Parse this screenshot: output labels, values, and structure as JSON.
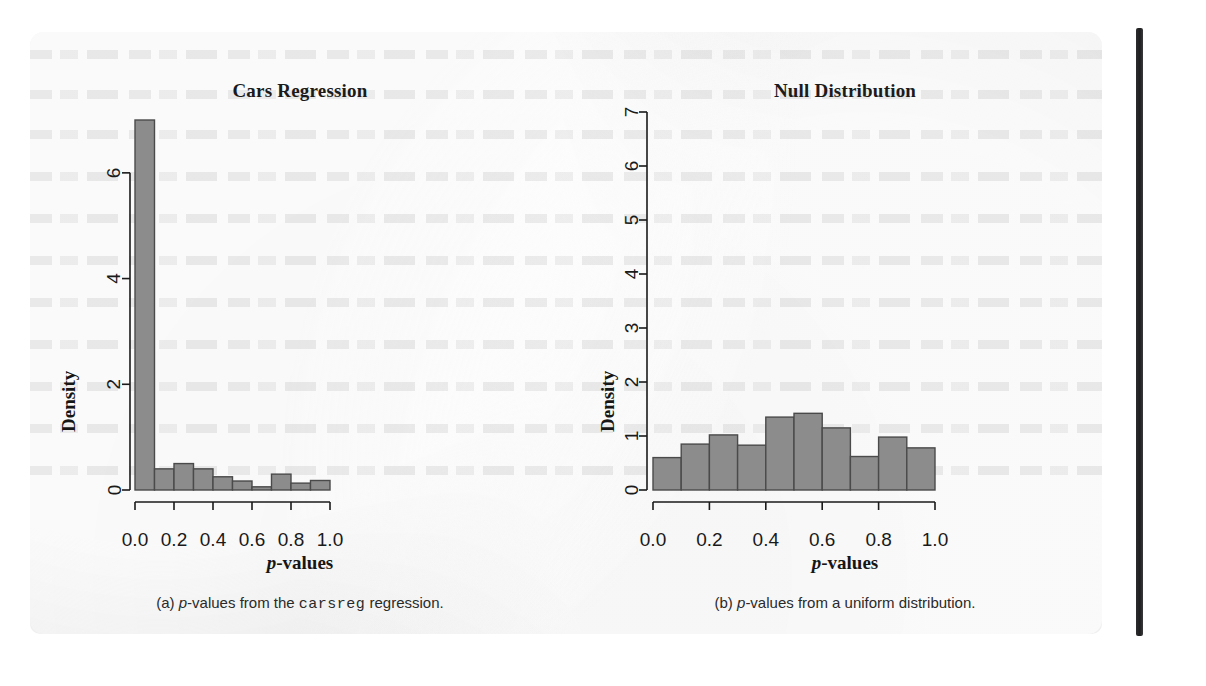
{
  "page": {
    "background_color": "#ffffff",
    "paper_color": "#efefef",
    "binding_color": "#2c2c2e"
  },
  "figure": {
    "bar_fill": "#8c8c8c",
    "bar_stroke": "#4a4a4a",
    "axis_color": "#1a1a1a"
  },
  "panel_a": {
    "title": "Cars Regression",
    "ylabel": "Density",
    "xlabel_italic": "p",
    "xlabel_rest": "-values",
    "caption_prefix": "(a) ",
    "caption_italic": "p",
    "caption_mid": "-values from the ",
    "caption_code": "carsreg",
    "caption_suffix": " regression."
  },
  "panel_b": {
    "title": "Null Distribution",
    "ylabel": "Density",
    "xlabel_italic": "p",
    "xlabel_rest": "-values",
    "caption_prefix": "(b) ",
    "caption_italic": "p",
    "caption_mid": "-values from a uniform distribution.",
    "caption_code": "",
    "caption_suffix": ""
  },
  "chart_data": [
    {
      "type": "bar",
      "id": "cars-regression-histogram",
      "title": "Cars Regression",
      "xlabel": "p-values",
      "ylabel": "Density",
      "xlim": [
        0.0,
        1.0
      ],
      "ylim": [
        0.0,
        7.0
      ],
      "xticks": [
        "0.0",
        "0.2",
        "0.4",
        "0.6",
        "0.8",
        "1.0"
      ],
      "xtick_values": [
        0.0,
        0.2,
        0.4,
        0.6,
        0.8,
        1.0
      ],
      "yticks": [
        "0",
        "2",
        "4",
        "6"
      ],
      "ytick_values": [
        0,
        2,
        4,
        6
      ],
      "grid": false,
      "legend": "none",
      "bin_edges": [
        0.0,
        0.1,
        0.2,
        0.3,
        0.4,
        0.5,
        0.6,
        0.7,
        0.8,
        0.9,
        1.0
      ],
      "categories": [
        "0.0-0.1",
        "0.1-0.2",
        "0.2-0.3",
        "0.3-0.4",
        "0.4-0.5",
        "0.5-0.6",
        "0.6-0.7",
        "0.7-0.8",
        "0.8-0.9",
        "0.9-1.0"
      ],
      "values": [
        7.0,
        0.4,
        0.5,
        0.4,
        0.25,
        0.17,
        0.06,
        0.3,
        0.13,
        0.18
      ]
    },
    {
      "type": "bar",
      "id": "null-distribution-histogram",
      "title": "Null Distribution",
      "xlabel": "p-values",
      "ylabel": "Density",
      "xlim": [
        0.0,
        1.0
      ],
      "ylim": [
        0.0,
        7.0
      ],
      "xticks": [
        "0.0",
        "0.2",
        "0.4",
        "0.6",
        "0.8",
        "1.0"
      ],
      "xtick_values": [
        0.0,
        0.2,
        0.4,
        0.6,
        0.8,
        1.0
      ],
      "yticks": [
        "0",
        "1",
        "2",
        "3",
        "4",
        "5",
        "6",
        "7"
      ],
      "ytick_values": [
        0,
        1,
        2,
        3,
        4,
        5,
        6,
        7
      ],
      "grid": false,
      "legend": "none",
      "bin_edges": [
        0.0,
        0.1,
        0.2,
        0.3,
        0.4,
        0.5,
        0.6,
        0.7,
        0.8,
        0.9,
        1.0
      ],
      "categories": [
        "0.0-0.1",
        "0.1-0.2",
        "0.2-0.3",
        "0.3-0.4",
        "0.4-0.5",
        "0.5-0.6",
        "0.6-0.7",
        "0.7-0.8",
        "0.8-0.9",
        "0.9-1.0"
      ],
      "values": [
        0.6,
        0.85,
        1.02,
        0.83,
        1.35,
        1.42,
        1.15,
        0.62,
        0.98,
        0.78
      ]
    }
  ]
}
